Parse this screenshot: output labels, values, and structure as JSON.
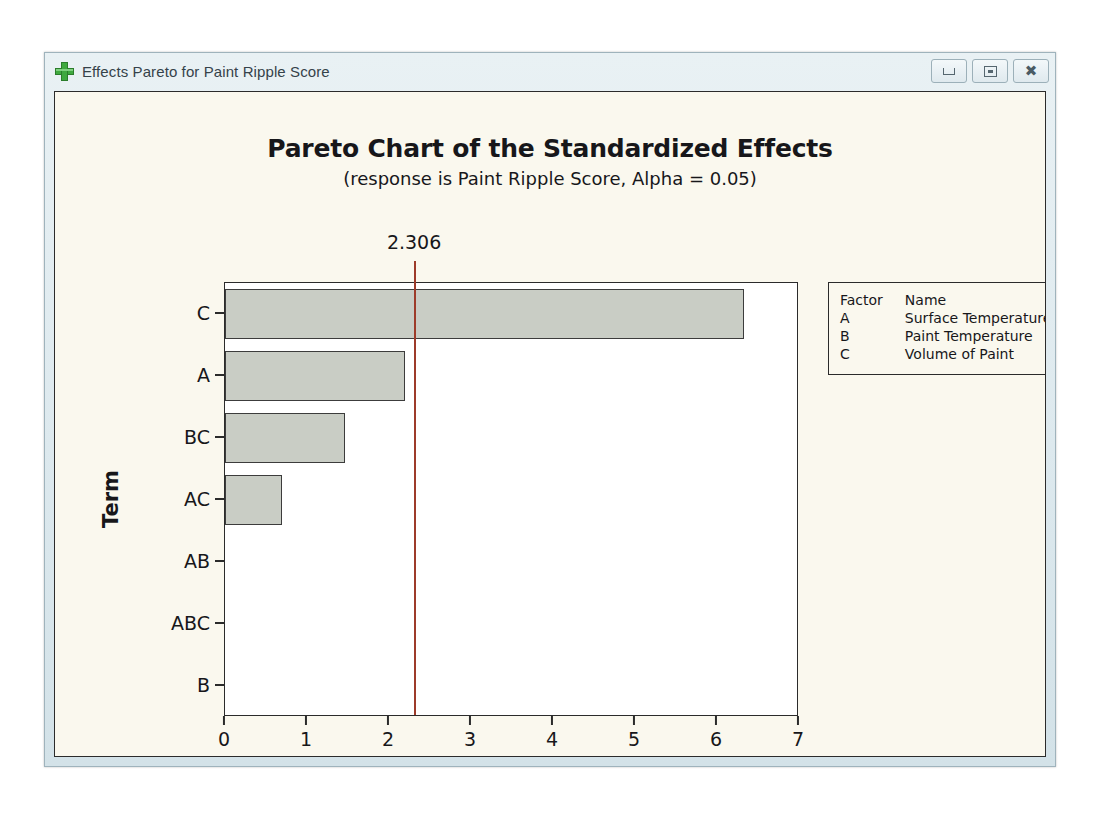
{
  "window": {
    "title": "Effects Pareto for Paint Ripple Score",
    "icon": "green-plus-icon",
    "buttons": {
      "minimize": "Minimize",
      "maximize": "Maximize",
      "close": "Close"
    }
  },
  "chart_data": {
    "type": "bar",
    "orientation": "horizontal",
    "title": "Pareto Chart of the Standardized Effects",
    "subtitle": "(response is Paint Ripple Score, Alpha = 0.05)",
    "xlabel": "Standardized Effect",
    "ylabel": "Term",
    "categories": [
      "C",
      "A",
      "BC",
      "AC",
      "AB",
      "ABC",
      "B"
    ],
    "values": [
      6.33,
      2.2,
      1.46,
      0.7,
      0.0,
      0.0,
      0.0
    ],
    "xlim": [
      0,
      7
    ],
    "xticks": [
      "0",
      "1",
      "2",
      "3",
      "4",
      "5",
      "6",
      "7"
    ],
    "grid": false,
    "reference_line": {
      "value": 2.306,
      "label": "2.306",
      "color": "#9d3b2a"
    },
    "bar_color": "#c9cdc5",
    "bar_border_color": "#3c3c3c",
    "legend_position": "top-right"
  },
  "legend": {
    "headers": [
      "Factor",
      "Name"
    ],
    "rows": [
      {
        "factor": "A",
        "name": "Surface Temperature"
      },
      {
        "factor": "B",
        "name": "Paint Temperature"
      },
      {
        "factor": "C",
        "name": "Volume of Paint"
      }
    ]
  }
}
